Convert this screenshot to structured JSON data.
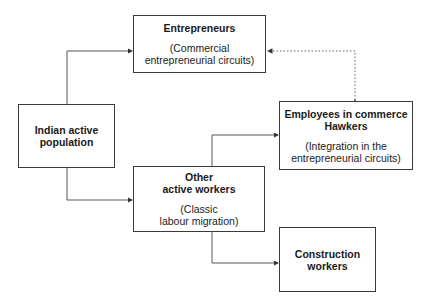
{
  "diagram": {
    "nodes": [
      {
        "id": "indian",
        "title": "Indian active\npopulation",
        "subtitle": ""
      },
      {
        "id": "entrepreneurs",
        "title": "Entrepreneurs",
        "subtitle": "(Commercial\nentrepreneurial circuits)"
      },
      {
        "id": "employees",
        "title": "Employees in commerce\nHawkers",
        "subtitle": "(Integration in the\nentrepreneurial circuits)"
      },
      {
        "id": "other",
        "title": "Other\nactive workers",
        "subtitle": "(Classic\nlabour migration)"
      },
      {
        "id": "construction",
        "title": "Construction\nworkers",
        "subtitle": ""
      }
    ],
    "edges": [
      {
        "from": "indian",
        "to": "entrepreneurs",
        "style": "solid"
      },
      {
        "from": "indian",
        "to": "other",
        "style": "solid"
      },
      {
        "from": "other",
        "to": "employees",
        "style": "solid"
      },
      {
        "from": "other",
        "to": "construction",
        "style": "solid"
      },
      {
        "from": "employees",
        "to": "entrepreneurs",
        "style": "dotted",
        "bidirectional": true
      }
    ]
  }
}
